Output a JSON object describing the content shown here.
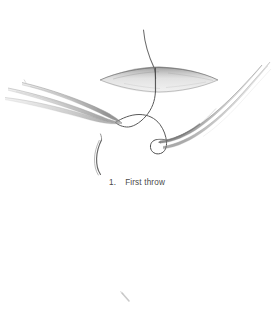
{
  "figure": {
    "caption": {
      "number": "1.",
      "text": "First throw"
    },
    "medium": "pencil-line-art-illustration",
    "background_color": "#ffffff",
    "ink_color": "#555555",
    "shading_color": "#9a9a9a",
    "elements": [
      {
        "name": "wound-incision",
        "label": "wound",
        "shape": "lens-ellipse",
        "center": [
          159,
          80
        ],
        "width": 118,
        "height": 14
      },
      {
        "name": "suture-thread-upper",
        "label": "suture thread above wound"
      },
      {
        "name": "suture-thread-loop",
        "label": "loop of suture around instrument"
      },
      {
        "name": "suture-thread-tail",
        "label": "free suture tail"
      },
      {
        "name": "left-forceps",
        "label": "left forceps",
        "orientation": "pointing-lower-right",
        "tip": [
          122,
          123
        ]
      },
      {
        "name": "right-forceps",
        "label": "right angled forceps",
        "orientation": "pointing-lower-left",
        "tip": [
          160,
          141
        ]
      },
      {
        "name": "scan-artifact-mark",
        "label": "faint scan artifact",
        "position": [
          126,
          297
        ]
      }
    ]
  }
}
